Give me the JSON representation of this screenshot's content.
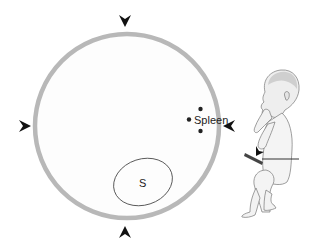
{
  "diagram": {
    "type": "ultrasound-schematic",
    "cross_section": {
      "shape": "circle",
      "stroke_color": "#b8b8b8",
      "fill_color": "#fdfdfd"
    },
    "labels": {
      "spleen": "Spleen",
      "stomach": "S"
    },
    "arrowheads": [
      {
        "position": "top",
        "direction": "down"
      },
      {
        "position": "left",
        "direction": "right"
      },
      {
        "position": "right",
        "direction": "left"
      },
      {
        "position": "bottom",
        "direction": "up"
      }
    ],
    "markers": {
      "spleen_dots": 3,
      "dot_color": "#222222"
    },
    "inset": {
      "description": "fetus-figure-with-transducer-plane",
      "plane_line_color": "#333333",
      "probe_color": "#444444"
    }
  }
}
